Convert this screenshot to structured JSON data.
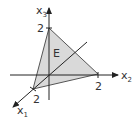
{
  "diagram": {
    "type": "3d-coordinate-plane",
    "colors": {
      "axis": "#222222",
      "plane_fill": "#d9d9d9",
      "plane_edge": "#555555",
      "background": "#ffffff"
    },
    "axes": [
      {
        "name": "x1",
        "label_main": "x",
        "label_sub": "1",
        "intercept_label": "2"
      },
      {
        "name": "x2",
        "label_main": "x",
        "label_sub": "2",
        "intercept_label": "2"
      },
      {
        "name": "x3",
        "label_main": "x",
        "label_sub": "3",
        "intercept_label": "2"
      }
    ],
    "plane": {
      "label": "E",
      "intercepts": {
        "x1": 2,
        "x2": 2,
        "x3": 2
      }
    }
  }
}
